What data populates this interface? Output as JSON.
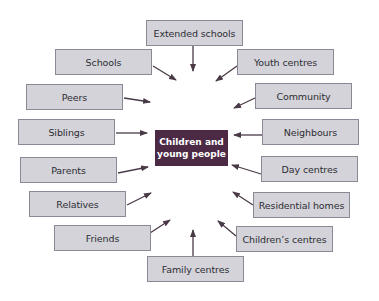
{
  "diagram": {
    "center": {
      "line1": "Children and",
      "line2": "young people",
      "color": "#4c2a45"
    },
    "nodes": [
      {
        "id": "extended-schools",
        "label": "Extended schools"
      },
      {
        "id": "schools",
        "label": "Schools"
      },
      {
        "id": "youth-centres",
        "label": "Youth centres"
      },
      {
        "id": "peers",
        "label": "Peers"
      },
      {
        "id": "community",
        "label": "Community"
      },
      {
        "id": "siblings",
        "label": "Siblings"
      },
      {
        "id": "neighbours",
        "label": "Neighbours"
      },
      {
        "id": "parents",
        "label": "Parents"
      },
      {
        "id": "day-centres",
        "label": "Day centres"
      },
      {
        "id": "relatives",
        "label": "Relatives"
      },
      {
        "id": "residential-homes",
        "label": "Residential homes"
      },
      {
        "id": "friends",
        "label": "Friends"
      },
      {
        "id": "childrens-centres",
        "label": "Children’s centres"
      },
      {
        "id": "family-centres",
        "label": "Family centres"
      }
    ],
    "edge_direction": "all nodes point toward center",
    "colors": {
      "box_fill": "#d3d3d9",
      "box_border": "#8a8a96",
      "arrow": "#4a3a48"
    }
  }
}
